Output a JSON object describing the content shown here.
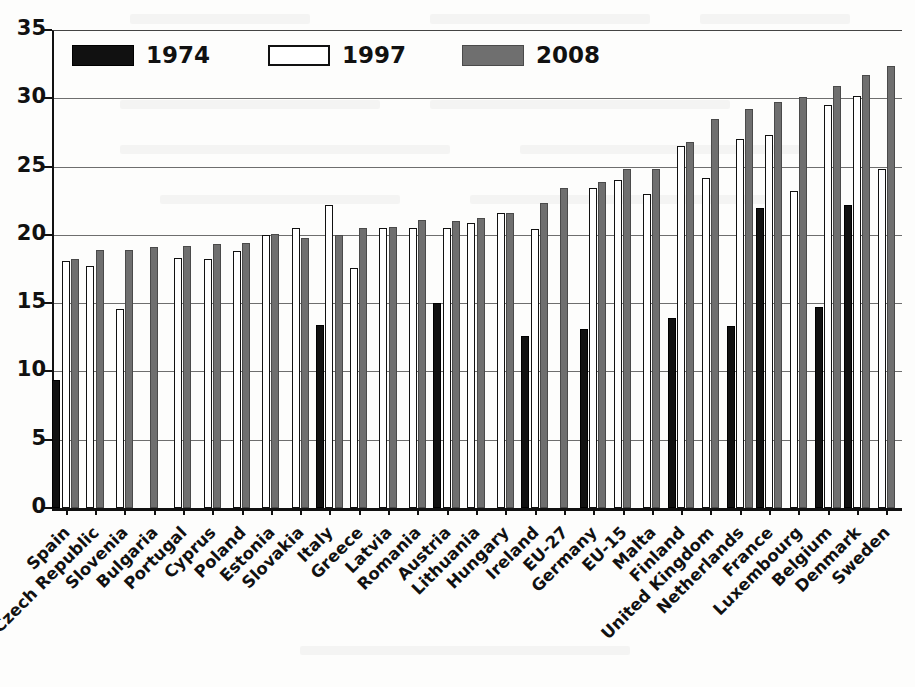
{
  "chart_data": {
    "type": "bar",
    "title": "",
    "subtitle": "",
    "xlabel": "",
    "ylabel": "",
    "ylim": [
      0,
      35
    ],
    "ytick_values": [
      0,
      5,
      10,
      15,
      20,
      25,
      30,
      35
    ],
    "ytick_labels": [
      "0",
      "5",
      "10",
      "15",
      "20",
      "25",
      "30",
      "35"
    ],
    "grid": "horizontal",
    "legend_position": "top-left-inside",
    "categories": [
      "Spain",
      "Czech Republic",
      "Slovenia",
      "Bulgaria",
      "Portugal",
      "Cyprus",
      "Poland",
      "Estonia",
      "Slovakia",
      "Italy",
      "Greece",
      "Latvia",
      "Romania",
      "Austria",
      "Lithuania",
      "Hungary",
      "Ireland",
      "EU-27",
      "Germany",
      "EU-15",
      "Malta",
      "Finland",
      "United Kingdom",
      "Netherlands",
      "France",
      "Luxembourg",
      "Belgium",
      "Denmark",
      "Sweden"
    ],
    "series": [
      {
        "name": "1974",
        "color": "#111111",
        "values": [
          9.4,
          null,
          null,
          null,
          null,
          null,
          null,
          null,
          null,
          13.4,
          null,
          null,
          null,
          15.0,
          null,
          null,
          12.6,
          null,
          13.1,
          null,
          null,
          13.9,
          null,
          13.3,
          22.0,
          null,
          14.7,
          22.2,
          null
        ]
      },
      {
        "name": "1997",
        "color": "#ffffff",
        "values": [
          18.1,
          17.7,
          14.6,
          null,
          18.3,
          18.2,
          18.8,
          20.0,
          20.5,
          22.2,
          17.6,
          20.5,
          20.5,
          20.5,
          20.9,
          21.6,
          20.4,
          null,
          23.4,
          24.0,
          23.0,
          26.5,
          24.2,
          27.0,
          27.3,
          23.2,
          29.5,
          30.2,
          24.8
        ]
      },
      {
        "name": "2008",
        "color": "#6f6f6f",
        "values": [
          18.2,
          18.9,
          18.9,
          19.1,
          19.2,
          19.3,
          19.4,
          20.1,
          19.8,
          20.0,
          20.5,
          20.6,
          21.1,
          21.0,
          21.2,
          21.6,
          22.3,
          23.4,
          23.9,
          24.8,
          24.8,
          26.8,
          28.5,
          29.2,
          29.7,
          30.1,
          30.9,
          31.7,
          32.4
        ]
      }
    ]
  },
  "legend": {
    "items": [
      {
        "label": "1974",
        "swatch": "solid-black"
      },
      {
        "label": "1997",
        "swatch": "outline-white"
      },
      {
        "label": "2008",
        "swatch": "solid-gray"
      }
    ]
  }
}
